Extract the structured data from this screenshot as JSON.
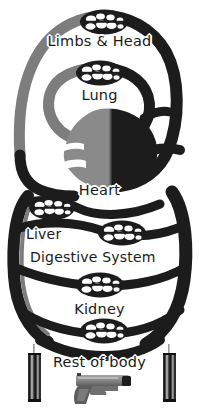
{
  "figure": {
    "background_color": "#ffffff",
    "width": 199,
    "height": 415
  },
  "labels": {
    "limbs_head": "Limbs & Head",
    "lung": "Lung",
    "heart": "Heart",
    "liver": "Liver",
    "digestive_system": "Digestive System",
    "kidney": "Kidney",
    "rest_of_body": "Rest of body"
  },
  "colors": {
    "vessel_dark": "#1c1c1c",
    "vessel_gray": "#7d7d7d",
    "heart_dark": "#1c1c1c",
    "heart_gray": "#8a8a8a",
    "object_gray": "#8e8e8e",
    "object_dark": "#2a2a2a",
    "background": "#ffffff",
    "text": "#1a1a1a"
  },
  "capillary_beds": [
    {
      "name": "limbs-head-bed",
      "cx": 104,
      "cy": 22,
      "rx": 24,
      "ry": 13
    },
    {
      "name": "lung-bed",
      "cx": 100,
      "cy": 73,
      "rx": 24,
      "ry": 13
    },
    {
      "name": "liver-bed",
      "cx": 52,
      "cy": 208,
      "rx": 23,
      "ry": 12
    },
    {
      "name": "digestive-bed",
      "cx": 122,
      "cy": 233,
      "rx": 24,
      "ry": 13
    },
    {
      "name": "kidney-upper-bed",
      "cx": 100,
      "cy": 285,
      "rx": 24,
      "ry": 13
    },
    {
      "name": "kidney-lower-bed",
      "cx": 104,
      "cy": 330,
      "rx": 24,
      "ry": 13
    }
  ],
  "objects": {
    "left_cylinder": {
      "name": "left-cylinder",
      "x": 28,
      "y": 352,
      "w": 14,
      "h": 50
    },
    "right_cylinder": {
      "name": "right-cylinder",
      "x": 163,
      "y": 352,
      "w": 14,
      "h": 50
    },
    "pistol": {
      "name": "pistol",
      "x": 75,
      "y": 374,
      "w": 58,
      "h": 30,
      "orientation": "facing-right"
    }
  }
}
